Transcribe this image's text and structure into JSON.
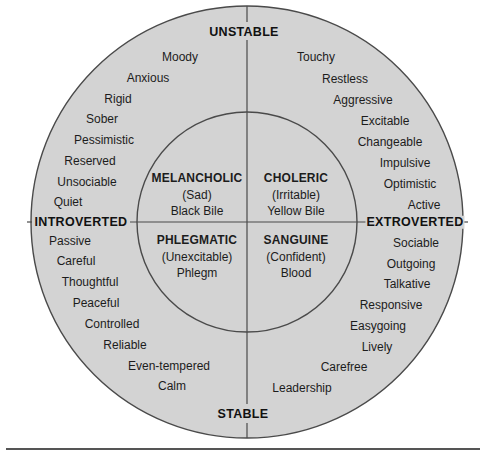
{
  "colors": {
    "background": "#ffffff",
    "circle_fill": "#d3d3d3",
    "line": "#4a4a4a",
    "text": "#1c1c1c"
  },
  "axes": {
    "top": "UNSTABLE",
    "bottom": "STABLE",
    "left": "INTROVERTED",
    "right": "EXTROVERTED"
  },
  "temperaments": [
    {
      "name": "MELANCHOLIC",
      "mood": "(Sad)",
      "humor": "Black Bile",
      "quadrant": "unstable-introverted"
    },
    {
      "name": "CHOLERIC",
      "mood": "(Irritable)",
      "humor": "Yellow Bile",
      "quadrant": "unstable-extroverted"
    },
    {
      "name": "PHLEGMATIC",
      "mood": "(Unexcitable)",
      "humor": "Phlegm",
      "quadrant": "stable-introverted"
    },
    {
      "name": "SANGUINE",
      "mood": "(Confident)",
      "humor": "Blood",
      "quadrant": "stable-extroverted"
    }
  ],
  "traits": {
    "unstable_introverted": [
      "Moody",
      "Anxious",
      "Rigid",
      "Sober",
      "Pessimistic",
      "Reserved",
      "Unsociable",
      "Quiet"
    ],
    "unstable_extroverted": [
      "Touchy",
      "Restless",
      "Aggressive",
      "Excitable",
      "Changeable",
      "Impulsive",
      "Optimistic",
      "Active"
    ],
    "stable_introverted": [
      "Passive",
      "Careful",
      "Thoughtful",
      "Peaceful",
      "Controlled",
      "Reliable",
      "Even-tempered",
      "Calm"
    ],
    "stable_extroverted": [
      "Sociable",
      "Outgoing",
      "Talkative",
      "Responsive",
      "Easygoing",
      "Lively",
      "Carefree",
      "Leadership"
    ]
  }
}
